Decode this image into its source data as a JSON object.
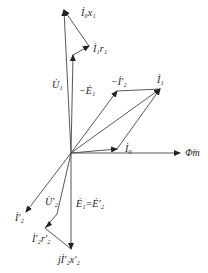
{
  "diagram": {
    "labels": {
      "I0x1": "İ₀x₁",
      "I1r1": "İ₁r₁",
      "U1": "U̇₁",
      "negE1": "−Ė₁",
      "negI2": "−İ′₂",
      "I1": "İ₁",
      "I0": "İ₀",
      "Phim": "Φ̇m",
      "I2": "İ′₂",
      "U2": "U̇′₂",
      "E1E2": "Ė₁=Ė′₂",
      "I2r2": "İ′₂r′₂",
      "jI2x2": "jİ′₂x′₂"
    },
    "colors": {
      "line": "#333333",
      "background": "#ffffff"
    }
  }
}
